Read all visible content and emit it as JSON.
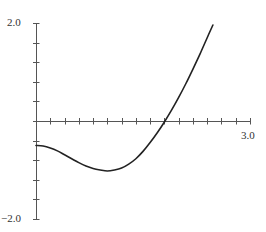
{
  "chart_data": {
    "type": "line",
    "title": "",
    "xlabel": "",
    "ylabel": "",
    "xlim": [
      0,
      3.0
    ],
    "ylim": [
      -2.0,
      2.0
    ],
    "grid": false,
    "legend": null,
    "x_ticks": {
      "step": 0.2,
      "labels": [
        {
          "value": 3.0,
          "text": "3.0"
        }
      ]
    },
    "y_ticks": {
      "step": 0.4,
      "labels": [
        {
          "value": 2.0,
          "text": "2.0"
        },
        {
          "value": -2.0,
          "text": "−2.0"
        }
      ]
    },
    "series": [
      {
        "name": "f(x)",
        "color": "#222222",
        "x": [
          0.0,
          0.1,
          0.2,
          0.3,
          0.4,
          0.5,
          0.6,
          0.7,
          0.8,
          0.9,
          1.0,
          1.1,
          1.2,
          1.3,
          1.4,
          1.5,
          1.6,
          1.7,
          1.8,
          1.9,
          2.0,
          2.1,
          2.2,
          2.3,
          2.4,
          2.48
        ],
        "y": [
          -0.5,
          -0.51,
          -0.55,
          -0.61,
          -0.69,
          -0.77,
          -0.85,
          -0.92,
          -0.97,
          -1.0,
          -1.02,
          -1.0,
          -0.96,
          -0.88,
          -0.77,
          -0.62,
          -0.44,
          -0.24,
          -0.02,
          0.22,
          0.48,
          0.76,
          1.06,
          1.37,
          1.7,
          1.96
        ]
      }
    ]
  },
  "labels": {
    "y_max": "2.0",
    "y_min": "−2.0",
    "x_max": "3.0"
  },
  "colors": {
    "axis": "#555555",
    "curve": "#222222",
    "background": "#ffffff"
  }
}
